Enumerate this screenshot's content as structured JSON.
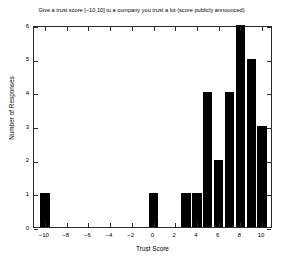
{
  "chart_data": {
    "type": "bar",
    "title": "Give a trust score [−10,10] to a company you trust a lot  (score publicly announced)",
    "xlabel": "Trust Score",
    "ylabel": "Number of Responses",
    "categories": [
      -10,
      -9,
      -8,
      -7,
      -6,
      -5,
      -4,
      -3,
      -2,
      -1,
      0,
      1,
      2,
      3,
      4,
      5,
      6,
      7,
      8,
      9,
      10
    ],
    "values": [
      1,
      0,
      0,
      0,
      0,
      0,
      0,
      0,
      0,
      0,
      1,
      0,
      0,
      1,
      1,
      4,
      2,
      4,
      6,
      5,
      3
    ],
    "xlim": [
      -11,
      11
    ],
    "ylim": [
      0,
      6
    ],
    "xticks": [
      -10,
      -8,
      -6,
      -4,
      -2,
      0,
      2,
      4,
      6,
      8,
      10
    ],
    "xtick_labels": [
      "−10",
      "−8",
      "−6",
      "−4",
      "−2",
      "0",
      "2",
      "4",
      "6",
      "8",
      "10"
    ],
    "yticks": [
      0,
      1,
      2,
      3,
      4,
      5,
      6
    ],
    "ytick_labels": [
      "0",
      "1",
      "2",
      "3",
      "4",
      "5",
      "6"
    ],
    "grid": false,
    "legend": null,
    "bar_color": "#000000",
    "background_color": "#FFFFFF",
    "axis_color": "#2A2A2A"
  }
}
